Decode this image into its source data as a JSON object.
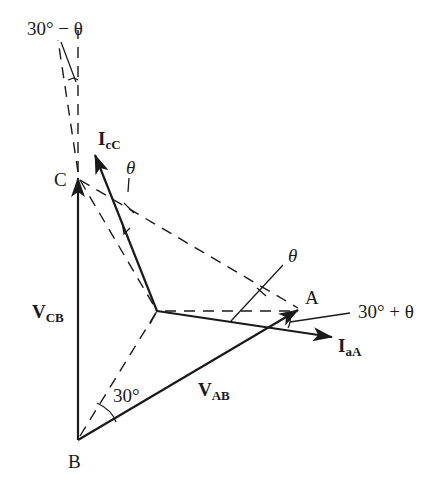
{
  "figure": {
    "type": "phasor-diagram",
    "points": {
      "A": {
        "label": "A"
      },
      "B": {
        "label": "B"
      },
      "C": {
        "label": "C"
      }
    },
    "phasors": {
      "v_cb": {
        "main": "V",
        "sub": "CB"
      },
      "v_ab": {
        "main": "V",
        "sub": "AB"
      },
      "i_cc": {
        "main": "I",
        "sub": "cC"
      },
      "i_aa": {
        "main": "I",
        "sub": "aA"
      }
    },
    "angles": {
      "thirty_minus_theta": "30° − θ",
      "thirty_plus_theta": "30° + θ",
      "theta_upper": "θ",
      "theta_right": "θ",
      "thirty": "30°"
    },
    "colors": {
      "ink": "#1a1a1a",
      "background": "#ffffff"
    }
  }
}
